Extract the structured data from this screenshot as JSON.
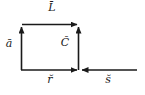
{
  "figure": {
    "type": "vector-diagram",
    "width": 145,
    "height": 95,
    "background_color": "#ffffff",
    "stroke_color": "#1a1a1a",
    "labels": {
      "top_vector": "L̄",
      "left_vector": "ā",
      "center_vector": "C̆",
      "bottom_left_vector": "r̆",
      "bottom_right_vector": "s̆"
    },
    "vectors": [
      {
        "name": "top-vector-L",
        "label": "L̄",
        "orientation": "horizontal",
        "direction": "right",
        "x1": 22,
        "y1": 24,
        "x2": 78,
        "y2": 24
      },
      {
        "name": "left-vector-a",
        "label": "ā",
        "orientation": "vertical",
        "direction": "up",
        "x1": 21,
        "y1": 70,
        "x2": 21,
        "y2": 26
      },
      {
        "name": "center-vector-C",
        "label": "C̆",
        "orientation": "vertical",
        "direction": "up",
        "x1": 78,
        "y1": 70,
        "x2": 78,
        "y2": 26
      },
      {
        "name": "bottom-left-vector-r",
        "label": "r̆",
        "orientation": "horizontal",
        "direction": "right",
        "x1": 21,
        "y1": 70,
        "x2": 78,
        "y2": 70
      },
      {
        "name": "bottom-right-vector-s",
        "label": "s̆",
        "orientation": "horizontal",
        "direction": "left",
        "x1": 137,
        "y1": 70,
        "x2": 81,
        "y2": 70
      }
    ]
  }
}
